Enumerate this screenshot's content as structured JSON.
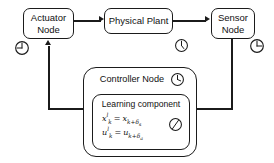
{
  "diagram": {
    "background_color": "#ffffff",
    "line_color": "#1b1b1b",
    "text_color": "#111111"
  },
  "nodes": {
    "actuator": {
      "label": "Actuator\nNode",
      "clock_name": "clock-icon-actuator"
    },
    "physical_plant": {
      "label": "Physical Plant",
      "clock_name": "clock-icon-physical-plant"
    },
    "sensor": {
      "label": "Sensor\nNode",
      "clock_name": "clock-icon-sensor"
    },
    "controller": {
      "label": "Controller Node",
      "clock_name": "clock-icon-controller"
    },
    "learning_component": {
      "label": "Learning component",
      "clock_name": "clock-icon-learning-component",
      "formulas": [
        {
          "id": "state-prediction",
          "lhs_base": "x",
          "lhs_sub": "k",
          "lhs_sup": "l",
          "equals": "=",
          "rhs_base": "x",
          "rhs_sub": "k+",
          "rhs_sub_delta": "δ",
          "rhs_sub_delta_sub": "s",
          "plain": "x_k^l = x_{k+δ_s}"
        },
        {
          "id": "input-prediction",
          "lhs_base": "u",
          "lhs_sub": "k",
          "lhs_sup": "l",
          "equals": "=",
          "rhs_base": "u",
          "rhs_sub": "k+",
          "rhs_sub_delta": "δ",
          "rhs_sub_delta_sub": "a",
          "plain": "u_k^l = u_{k+δ_a}"
        }
      ]
    }
  },
  "connectors": [
    {
      "name": "actuator-to-physical-plant",
      "from": "Actuator Node",
      "to": "Physical Plant",
      "direction": "right"
    },
    {
      "name": "physical-plant-to-sensor",
      "from": "Physical Plant",
      "to": "Sensor Node",
      "direction": "right"
    },
    {
      "name": "sensor-to-learning-component",
      "from": "Sensor Node",
      "to": "Learning component",
      "direction": "left"
    },
    {
      "name": "learning-component-to-actuator",
      "from": "Learning component",
      "to": "Actuator Node",
      "direction": "up"
    }
  ]
}
